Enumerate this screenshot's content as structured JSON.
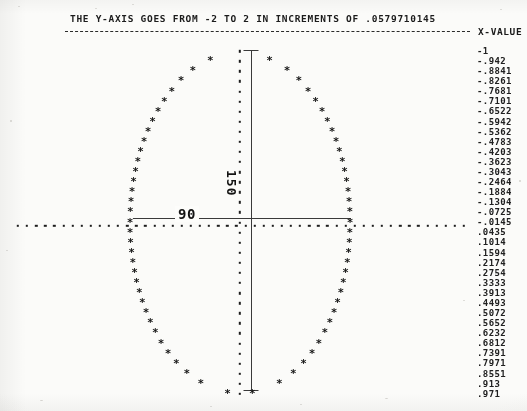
{
  "header": {
    "title": "THE Y-AXIS GOES FROM -2 TO 2 IN INCREMENTS OF .0579710145",
    "x_value_header": "X-VALUE"
  },
  "annotations": {
    "vertical_label": "150",
    "horizontal_label": "90"
  },
  "chart_data": {
    "type": "scatter",
    "title": "THE Y-AXIS GOES FROM -2 TO 2 IN INCREMENTS OF .0579710145",
    "xlabel": "",
    "ylabel": "X-VALUE",
    "grid": false,
    "legend": null,
    "axis_note": "Y-axis runs from -2 to 2 in increments of .0579710145; plotted sideways — the listed X-VALUE column is the row index axis running top to bottom.",
    "ylim": [
      -2,
      2
    ],
    "marker": "*",
    "shape": "ellipse",
    "center": [
      240,
      225
    ],
    "semi_axis_x": 110,
    "semi_axis_y": 170,
    "measurements": [
      {
        "label": "150",
        "orientation": "vertical"
      },
      {
        "label": "90",
        "orientation": "horizontal"
      }
    ],
    "x_values": [
      "-1",
      "-.942",
      "-.8841",
      "-.8261",
      "-.7681",
      "-.7101",
      "-.6522",
      "-.5942",
      "-.5362",
      "-.4783",
      "-.4203",
      "-.3623",
      "-.3043",
      "-.2464",
      "-.1884",
      "-.1304",
      "-.0725",
      "-.0145",
      ".0435",
      ".1014",
      ".1594",
      ".2174",
      ".2754",
      ".3333",
      ".3913",
      ".4493",
      ".5072",
      ".5652",
      ".6232",
      ".6812",
      ".7391",
      ".7971",
      ".8551",
      ".913",
      ".971"
    ]
  }
}
